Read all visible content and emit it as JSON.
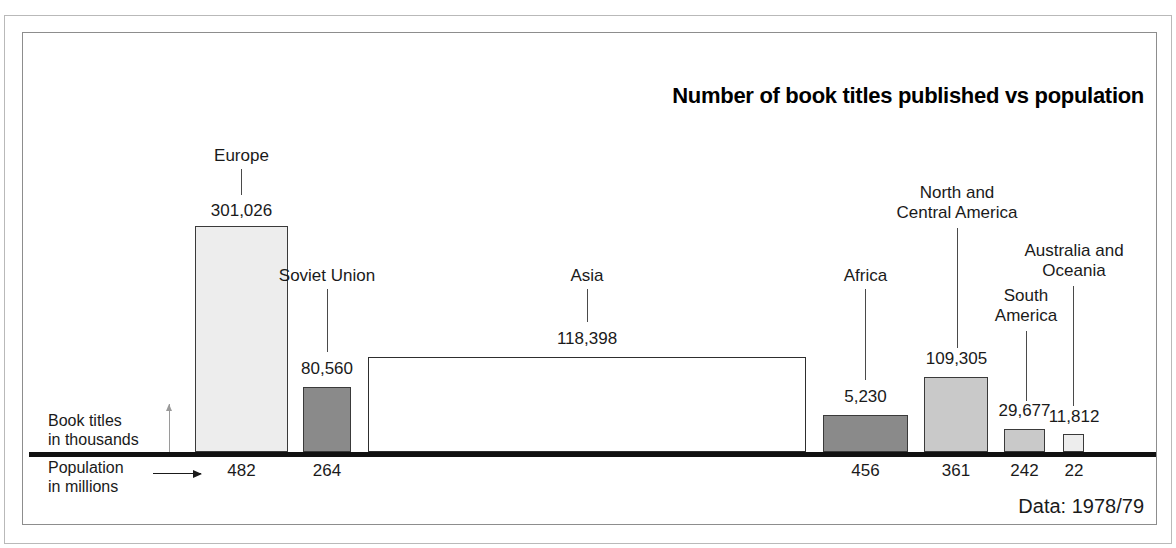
{
  "chart_data": {
    "type": "bar",
    "title": "Number of book titles published vs population",
    "subtitle": "",
    "xlabel": "Population in millions",
    "ylabel": "Book titles in thousands",
    "source_note": "Data: 1978/79",
    "grid": false,
    "legend": "none",
    "note": "Variable-width bar chart (mosaic): bar WIDTH encodes population in millions, bar HEIGHT encodes number of book titles published.",
    "categories": [
      "Europe",
      "Soviet Union",
      "Asia",
      "Africa",
      "North and Central America",
      "South America",
      "Australia and Oceania"
    ],
    "values": [
      301026,
      80560,
      118398,
      5230,
      109305,
      29677,
      11812
    ],
    "value_labels": [
      "301,026",
      "80,560",
      "118,398",
      "5,230",
      "109,305",
      "29,677",
      "11,812"
    ],
    "widths": [
      482,
      264,
      2465,
      456,
      361,
      242,
      22
    ],
    "width_labels": [
      "482",
      "264",
      "2,465",
      "456",
      "361",
      "242",
      "22"
    ],
    "series": [
      {
        "name": "Book titles published",
        "values": [
          301026,
          80560,
          118398,
          5230,
          109305,
          29677,
          11812
        ]
      },
      {
        "name": "Population (millions)",
        "values": [
          482,
          264,
          2465,
          456,
          361,
          242,
          22
        ]
      }
    ],
    "bars": [
      {
        "label": "Europe",
        "value": 301026,
        "value_label": "301,026",
        "population": 482,
        "population_label": "482",
        "fill": "#ededed",
        "x": 172,
        "w": 93,
        "top": 193
      },
      {
        "label": "Soviet Union",
        "value": 80560,
        "value_label": "80,560",
        "population": 264,
        "population_label": "264",
        "fill": "#8a8a8a",
        "x": 280,
        "w": 48,
        "top": 354
      },
      {
        "label": "Asia",
        "value": 118398,
        "value_label": "118,398",
        "population": 2465,
        "population_label": "2,465",
        "fill": "#ffffff",
        "x": 345,
        "w": 438,
        "top": 324
      },
      {
        "label": "Africa",
        "value": 5230,
        "value_label": "5,230",
        "population": 456,
        "population_label": "456",
        "fill": "#8a8a8a",
        "x": 800,
        "w": 85,
        "top": 382
      },
      {
        "label": "North and Central America",
        "value": 109305,
        "value_label": "109,305",
        "population": 361,
        "population_label": "361",
        "fill": "#c9c9c9",
        "x": 901,
        "w": 64,
        "top": 344
      },
      {
        "label": "South America",
        "value": 29677,
        "value_label": "29,677",
        "population": 242,
        "population_label": "242",
        "fill": "#c9c9c9",
        "x": 981,
        "w": 41,
        "top": 396
      },
      {
        "label": "Australia and Oceania",
        "value": 11812,
        "value_label": "11,812",
        "population": 22,
        "population_label": "22",
        "fill": "#ededed",
        "x": 1040,
        "w": 21,
        "top": 401
      }
    ],
    "axis_captions": {
      "titles_line1": "Book titles",
      "titles_line2": "in thousands",
      "population_line1": "Population",
      "population_line2": "in millions"
    }
  },
  "colors": {
    "background": "#ffffff",
    "frame": "#8d8d8d",
    "outer_frame": "#b9b9b9",
    "baseline": "#111111",
    "text": "#1a1a1a",
    "bar_light": "#ededed",
    "bar_mid": "#c9c9c9",
    "bar_dark": "#8a8a8a",
    "bar_white": "#ffffff"
  }
}
